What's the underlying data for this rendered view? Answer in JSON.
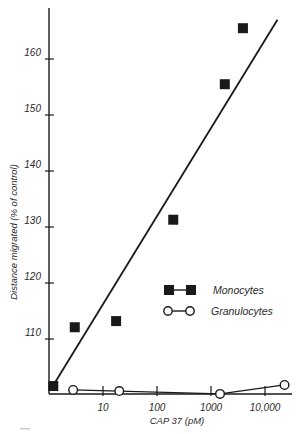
{
  "chart_data": {
    "type": "scatter",
    "title": "",
    "xlabel": "CAP 37  (pM)",
    "ylabel": "Distance migrated  (% of control)",
    "xscale": "log",
    "xlim": [
      1,
      30000
    ],
    "ylim": [
      100,
      168
    ],
    "x_ticks": [
      10,
      100,
      1000,
      10000
    ],
    "x_tick_labels": [
      "10",
      "100",
      "1000",
      "10,000"
    ],
    "y_ticks": [
      110,
      120,
      130,
      140,
      150,
      160
    ],
    "y_tick_labels": [
      "110",
      "120",
      "130",
      "140",
      "150",
      "160"
    ],
    "grid": false,
    "legend_position": "right-center",
    "series": [
      {
        "name": "Monocytes",
        "marker": "filled-square",
        "color": "#1a1a1a",
        "x": [
          1.2,
          3,
          17.5,
          200,
          1800,
          3900
        ],
        "y": [
          101.6,
          112.1,
          113.2,
          131.3,
          155.5,
          165.5
        ],
        "fit_line": {
          "x": [
            1.25,
            17000
          ],
          "y": [
            102,
            167
          ]
        }
      },
      {
        "name": "Granulocytes",
        "marker": "open-circle",
        "color": "#1a1a1a",
        "connected": true,
        "x": [
          2.8,
          20,
          1470,
          23000
        ],
        "y": [
          100.9,
          100.7,
          100.2,
          101.8
        ]
      }
    ]
  },
  "legend": {
    "items": [
      {
        "label": "Monocytes"
      },
      {
        "label": "Granulocytes"
      }
    ]
  }
}
